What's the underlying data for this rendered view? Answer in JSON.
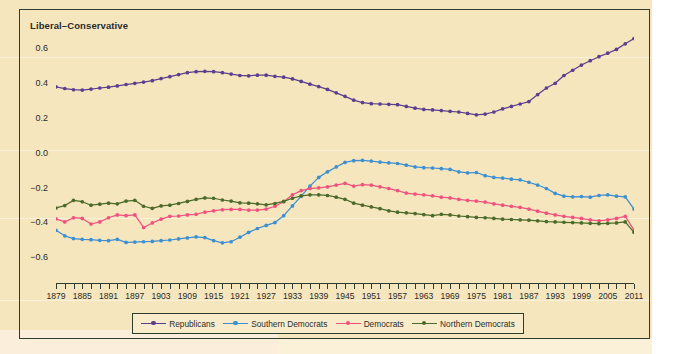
{
  "chart_data": {
    "type": "line",
    "title": "Liberal–Conservative",
    "xlabel": "",
    "ylabel": "Liberal–Conservative",
    "xlim": [
      1879,
      2011
    ],
    "ylim": [
      -0.68,
      0.7
    ],
    "yticks": [
      0.6,
      0.4,
      0.2,
      0.0,
      -0.2,
      -0.4,
      -0.6
    ],
    "ytick_labels": [
      "0.6",
      "0.4",
      "0.2",
      "0.0",
      "-0.2",
      "-0.4",
      "-0.6"
    ],
    "xticks": [
      1879,
      1885,
      1891,
      1897,
      1903,
      1909,
      1915,
      1921,
      1927,
      1933,
      1939,
      1945,
      1951,
      1957,
      1963,
      1969,
      1975,
      1981,
      1987,
      1993,
      1999,
      2005,
      2011
    ],
    "xtick_labels": [
      "1879",
      "1885",
      "1891",
      "1897",
      "1903",
      "1909",
      "1915",
      "1921",
      "1927",
      "1933",
      "1939",
      "1945",
      "1951",
      "1957",
      "1963",
      "1969",
      "1975",
      "1981",
      "1987",
      "1993",
      "1999",
      "2005",
      "2011"
    ],
    "minor_tick_step": 2,
    "grid": false,
    "legend_position": "bottom",
    "x": [
      1879,
      1881,
      1883,
      1885,
      1887,
      1889,
      1891,
      1893,
      1895,
      1897,
      1899,
      1901,
      1903,
      1905,
      1907,
      1909,
      1911,
      1913,
      1915,
      1917,
      1919,
      1921,
      1923,
      1925,
      1927,
      1929,
      1931,
      1933,
      1935,
      1937,
      1939,
      1941,
      1943,
      1945,
      1947,
      1949,
      1951,
      1953,
      1955,
      1957,
      1959,
      1961,
      1963,
      1965,
      1967,
      1969,
      1971,
      1973,
      1975,
      1977,
      1979,
      1981,
      1983,
      1985,
      1987,
      1989,
      1991,
      1993,
      1995,
      1997,
      1999,
      2001,
      2003,
      2005,
      2007,
      2009,
      2011
    ],
    "series": [
      {
        "name": "Republicans",
        "color": "#5b3f8e",
        "values": [
          0.385,
          0.375,
          0.368,
          0.366,
          0.372,
          0.378,
          0.383,
          0.39,
          0.398,
          0.405,
          0.412,
          0.42,
          0.432,
          0.443,
          0.455,
          0.466,
          0.472,
          0.474,
          0.472,
          0.466,
          0.458,
          0.45,
          0.448,
          0.452,
          0.452,
          0.445,
          0.44,
          0.43,
          0.416,
          0.4,
          0.386,
          0.37,
          0.35,
          0.33,
          0.308,
          0.294,
          0.288,
          0.286,
          0.284,
          0.282,
          0.272,
          0.262,
          0.255,
          0.252,
          0.248,
          0.244,
          0.24,
          0.232,
          0.224,
          0.228,
          0.24,
          0.258,
          0.272,
          0.286,
          0.3,
          0.34,
          0.378,
          0.405,
          0.45,
          0.48,
          0.51,
          0.535,
          0.558,
          0.578,
          0.6,
          0.632,
          0.662
        ]
      },
      {
        "name": "Southern Democrats",
        "color": "#3d8fd1",
        "values": [
          -0.44,
          -0.472,
          -0.488,
          -0.492,
          -0.494,
          -0.498,
          -0.5,
          -0.492,
          -0.51,
          -0.508,
          -0.506,
          -0.504,
          -0.5,
          -0.496,
          -0.49,
          -0.484,
          -0.478,
          -0.482,
          -0.5,
          -0.512,
          -0.506,
          -0.48,
          -0.452,
          -0.43,
          -0.412,
          -0.396,
          -0.356,
          -0.3,
          -0.244,
          -0.186,
          -0.136,
          -0.104,
          -0.076,
          -0.05,
          -0.04,
          -0.038,
          -0.042,
          -0.048,
          -0.052,
          -0.056,
          -0.066,
          -0.076,
          -0.08,
          -0.082,
          -0.086,
          -0.09,
          -0.104,
          -0.11,
          -0.108,
          -0.126,
          -0.136,
          -0.14,
          -0.146,
          -0.15,
          -0.164,
          -0.18,
          -0.2,
          -0.228,
          -0.244,
          -0.248,
          -0.246,
          -0.25,
          -0.24,
          -0.236,
          -0.244,
          -0.248,
          -0.318
        ]
      },
      {
        "name": "Democrats",
        "color": "#f0527f",
        "values": [
          -0.374,
          -0.392,
          -0.368,
          -0.372,
          -0.404,
          -0.392,
          -0.368,
          -0.352,
          -0.356,
          -0.352,
          -0.424,
          -0.398,
          -0.376,
          -0.36,
          -0.358,
          -0.352,
          -0.348,
          -0.336,
          -0.328,
          -0.322,
          -0.32,
          -0.32,
          -0.324,
          -0.324,
          -0.318,
          -0.302,
          -0.276,
          -0.236,
          -0.212,
          -0.2,
          -0.196,
          -0.19,
          -0.18,
          -0.17,
          -0.186,
          -0.178,
          -0.18,
          -0.19,
          -0.2,
          -0.212,
          -0.226,
          -0.232,
          -0.236,
          -0.242,
          -0.25,
          -0.254,
          -0.262,
          -0.268,
          -0.272,
          -0.278,
          -0.288,
          -0.296,
          -0.302,
          -0.308,
          -0.318,
          -0.33,
          -0.342,
          -0.352,
          -0.36,
          -0.366,
          -0.372,
          -0.38,
          -0.386,
          -0.38,
          -0.372,
          -0.36,
          -0.44
        ]
      },
      {
        "name": "Northern Democrats",
        "color": "#4a6b2a",
        "values": [
          -0.312,
          -0.298,
          -0.268,
          -0.276,
          -0.296,
          -0.29,
          -0.284,
          -0.288,
          -0.272,
          -0.268,
          -0.302,
          -0.314,
          -0.3,
          -0.296,
          -0.286,
          -0.274,
          -0.262,
          -0.254,
          -0.256,
          -0.266,
          -0.272,
          -0.282,
          -0.284,
          -0.288,
          -0.294,
          -0.286,
          -0.274,
          -0.256,
          -0.242,
          -0.236,
          -0.236,
          -0.24,
          -0.25,
          -0.262,
          -0.284,
          -0.296,
          -0.306,
          -0.316,
          -0.328,
          -0.336,
          -0.34,
          -0.344,
          -0.35,
          -0.356,
          -0.348,
          -0.352,
          -0.358,
          -0.362,
          -0.366,
          -0.368,
          -0.372,
          -0.376,
          -0.378,
          -0.38,
          -0.382,
          -0.386,
          -0.39,
          -0.392,
          -0.394,
          -0.396,
          -0.398,
          -0.4,
          -0.402,
          -0.4,
          -0.398,
          -0.392,
          -0.452
        ]
      }
    ]
  },
  "legend": {
    "items": [
      {
        "label": "Republicans",
        "color": "#5b3f8e"
      },
      {
        "label": "Southern Democrats",
        "color": "#3d8fd1"
      },
      {
        "label": "Democrats",
        "color": "#f0527f"
      },
      {
        "label": "Northern Democrats",
        "color": "#4a6b2a"
      }
    ]
  },
  "colors": {
    "background": "#f6e6bd",
    "frame": "#2f3d2f",
    "text": "#2b2b2b"
  }
}
